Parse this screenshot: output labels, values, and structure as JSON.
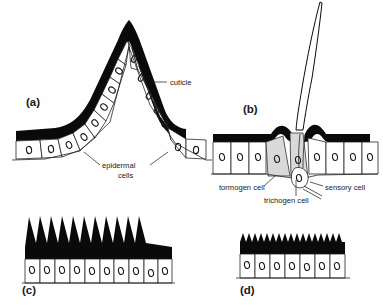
{
  "figure": {
    "background_color": "#ffffff",
    "ink_color": "#0a0a0a",
    "shaded_cell_color": "#d9d9d9",
    "width": 383,
    "height": 306
  },
  "panels": [
    {
      "id": "a",
      "letter": "(a)",
      "letter_x": 26,
      "letter_y": 106,
      "description": "conical cuticular process",
      "annotations": [
        {
          "name": "cuticle",
          "text": "cuticle",
          "x": 157,
          "y": 84
        },
        {
          "name": "epidermal-cells",
          "text_line1": "epidermal",
          "text_line2": "cells",
          "x": 112,
          "y": 168
        }
      ]
    },
    {
      "id": "b",
      "letter": "(b)",
      "letter_x": 243,
      "letter_y": 113,
      "description": "innervated sensory bristle (trichoid sensillum)",
      "annotations": [
        {
          "name": "tormogen-cell",
          "text": "tormogen cell",
          "x": 226,
          "y": 187
        },
        {
          "name": "sensory-cell",
          "text": "sensory cell",
          "x": 320,
          "y": 187
        },
        {
          "name": "trichogen-cell",
          "text": "trichogen cell",
          "x": 268,
          "y": 201
        }
      ]
    },
    {
      "id": "c",
      "letter": "(c)",
      "letter_x": 22,
      "letter_y": 294,
      "description": "row of tall cuticular spines",
      "spine_count": 10,
      "cell_count": 10,
      "annotations": []
    },
    {
      "id": "d",
      "letter": "(d)",
      "letter_x": 240,
      "letter_y": 294,
      "description": "row of small cuticular serrations",
      "spine_count": 14,
      "cell_count": 7,
      "annotations": []
    }
  ],
  "labels_index": {
    "cuticle": "cuticle",
    "epidermal_cells_1": "epidermal",
    "epidermal_cells_2": "cells",
    "tormogen": "tormogen cell",
    "trichogen": "trichogen cell",
    "sensory": "sensory cell",
    "letter_a": "(a)",
    "letter_b": "(b)",
    "letter_c": "(c)",
    "letter_d": "(d)"
  }
}
